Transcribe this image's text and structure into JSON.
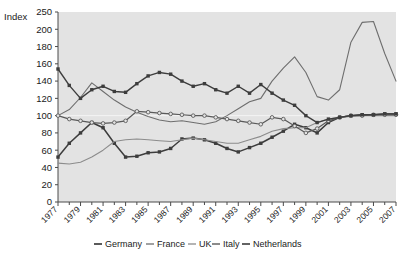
{
  "chart_data": {
    "type": "line",
    "title": "",
    "subtitle": "",
    "xlabel": "",
    "ylabel": "Index",
    "ylim": [
      0,
      250
    ],
    "xlim": [
      1977,
      2007
    ],
    "grid": false,
    "legend_position": "bottom",
    "y_ticks": [
      0,
      20,
      40,
      60,
      80,
      100,
      120,
      140,
      160,
      180,
      200,
      250
    ],
    "y_tick_labels": [
      "0",
      "20",
      "40",
      "60",
      "80",
      "100",
      "120",
      "140",
      "160",
      "180",
      "200",
      "250"
    ],
    "x_ticks": [
      1977,
      1979,
      1981,
      1983,
      1985,
      1987,
      1989,
      1991,
      1993,
      1995,
      1997,
      1999,
      2001,
      2003,
      2005,
      2007
    ],
    "x_tick_labels": [
      "1977",
      "1979",
      "1981",
      "1983",
      "1985",
      "1987",
      "1989",
      "1991",
      "1993",
      "1995",
      "1997",
      "1999",
      "2001",
      "2003",
      "2005",
      "2007"
    ],
    "x_minor_ticks": [
      1978,
      1980,
      1982,
      1984,
      1986,
      1988,
      1990,
      1992,
      1994,
      1996,
      1998,
      2000,
      2002,
      2004,
      2006
    ],
    "x": [
      1977,
      1978,
      1979,
      1980,
      1981,
      1982,
      1983,
      1984,
      1985,
      1986,
      1987,
      1988,
      1989,
      1990,
      1991,
      1992,
      1993,
      1994,
      1995,
      1996,
      1997,
      1998,
      1999,
      2000,
      2001,
      2002,
      2003,
      2004,
      2005,
      2006,
      2007
    ],
    "series": [
      {
        "name": "Germany",
        "color": "#3d3d3d",
        "marker": "filled-square",
        "width": 1.5,
        "values": [
          52,
          68,
          80,
          92,
          86,
          68,
          52,
          53,
          57,
          58,
          62,
          73,
          74,
          72,
          68,
          62,
          58,
          63,
          68,
          75,
          82,
          90,
          86,
          80,
          92,
          98,
          100,
          101,
          101,
          102,
          102
        ]
      },
      {
        "name": "France",
        "color": "#6e6e6e",
        "marker": "none",
        "width": 1.1,
        "values": [
          100,
          107,
          121,
          138,
          128,
          118,
          110,
          104,
          99,
          95,
          93,
          94,
          92,
          90,
          93,
          100,
          108,
          116,
          120,
          140,
          155,
          168,
          150,
          122,
          118,
          130,
          185,
          208,
          209,
          172,
          140
        ]
      },
      {
        "name": "UK",
        "color": "#8c8c8c",
        "marker": "none",
        "width": 1.1,
        "values": [
          45,
          44,
          46,
          52,
          60,
          70,
          72,
          73,
          72,
          71,
          70,
          72,
          74,
          72,
          70,
          68,
          68,
          72,
          76,
          82,
          85,
          86,
          86,
          92,
          96,
          98,
          99,
          100,
          100,
          100,
          100
        ]
      },
      {
        "name": "Italy",
        "color": "#5a5a5a",
        "marker": "open-circle",
        "width": 1.2,
        "values": [
          100,
          96,
          94,
          92,
          91,
          92,
          94,
          105,
          104,
          103,
          102,
          101,
          100,
          100,
          98,
          96,
          94,
          92,
          90,
          98,
          96,
          88,
          80,
          85,
          94,
          98,
          100,
          100,
          101,
          101,
          101
        ]
      },
      {
        "name": "Netherlands",
        "color": "#3d3d3d",
        "marker": "filled-square",
        "width": 1.4,
        "values": [
          154,
          135,
          120,
          130,
          134,
          128,
          127,
          137,
          146,
          150,
          148,
          140,
          134,
          137,
          130,
          126,
          134,
          126,
          136,
          126,
          118,
          112,
          100,
          92,
          96,
          98,
          100,
          101,
          101,
          102,
          102
        ]
      }
    ]
  },
  "legend": {
    "items": [
      {
        "label": "Germany"
      },
      {
        "label": "France"
      },
      {
        "label": "UK"
      },
      {
        "label": "Italy"
      },
      {
        "label": "Netherlands"
      }
    ]
  }
}
